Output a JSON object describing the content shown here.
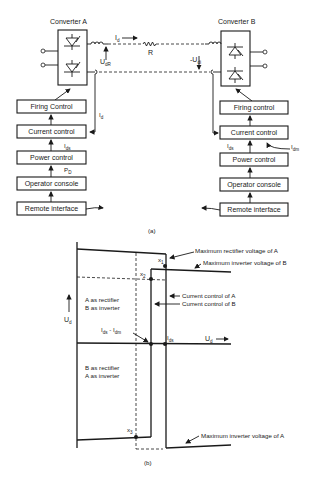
{
  "figure_a": {
    "caption": "(a)",
    "converter_a": {
      "title": "Converter A",
      "blocks": [
        "Firing Control",
        "Current control",
        "Power control",
        "Operator console",
        "Remote interface"
      ],
      "signals": {
        "current_ref": "I",
        "current_ref_sub": "ds",
        "power_ref": "P",
        "power_ref_sub": "D",
        "current_meas": "I",
        "current_meas_sub": "d"
      }
    },
    "converter_b": {
      "title": "Converter B",
      "blocks": [
        "Firing control",
        "Current control",
        "Power control",
        "Operator console",
        "Remote interface"
      ],
      "signals": {
        "current_ref": "I",
        "current_ref_sub": "ds",
        "margin": "I",
        "margin_sub": "dm"
      }
    },
    "link": {
      "current": "I",
      "current_sub": "d",
      "resistance": "R",
      "voltage_a": "U",
      "voltage_a_sub": "dR",
      "voltage_b": "-U",
      "voltage_b_sub": "di"
    }
  },
  "figure_b": {
    "caption": "(b)",
    "y_axis": "U",
    "y_axis_sub": "d",
    "x_axis": "U",
    "x_axis_sub": "d",
    "points": [
      "x",
      "x",
      "x"
    ],
    "point_subs": [
      "1",
      "2",
      "3"
    ],
    "region_upper": [
      "A as rectifier",
      "B as inverter"
    ],
    "region_lower": [
      "B as rectifier",
      "A as inverter"
    ],
    "label_ids": "I",
    "label_ids_sub": "ds",
    "label_margin": "I",
    "label_margin_mid": "ds",
    "label_margin_sep": " - I",
    "label_margin_sub": "dm",
    "annotations": [
      "Maximum rectifier voltage of A",
      "Maximum inverter voltage of B",
      "Current control of A",
      "Current control of B",
      "Maximum inverter voltage of A"
    ]
  }
}
